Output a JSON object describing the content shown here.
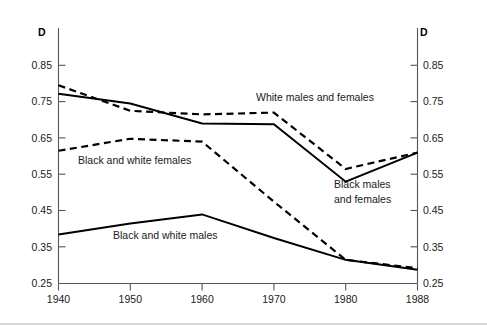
{
  "chart_data": {
    "type": "line",
    "title": "",
    "subtitle": "",
    "xlabel": "",
    "ylabel": "D",
    "ylabel_right": "D",
    "x": [
      1940,
      1950,
      1960,
      1970,
      1980,
      1988
    ],
    "categories": [
      "1940",
      "1950",
      "1960",
      "1970",
      "1980",
      "1988"
    ],
    "xticklabels": [
      "1940",
      "1950",
      "1960",
      "1970",
      "1980",
      "1988"
    ],
    "yticks": [
      0.25,
      0.35,
      0.45,
      0.55,
      0.65,
      0.75,
      0.85
    ],
    "yticklabels": [
      "0.25",
      "0.35",
      "0.45",
      "0.55",
      "0.65",
      "0.75",
      "0.85"
    ],
    "ylim": [
      0.25,
      0.85
    ],
    "grid": false,
    "legend_position": "inline-annotations",
    "axis_color": "#555555",
    "series_color": "#000000",
    "series": [
      {
        "name": "White males and females",
        "style": "dashed",
        "values": [
          0.795,
          0.725,
          0.715,
          0.72,
          0.565,
          0.61
        ]
      },
      {
        "name": "Black males and females",
        "style": "solid",
        "values": [
          0.772,
          0.745,
          0.69,
          0.688,
          0.53,
          0.61
        ]
      },
      {
        "name": "Black and white females",
        "style": "dashed",
        "values": [
          0.615,
          0.648,
          0.64,
          0.475,
          0.315,
          0.292
        ]
      },
      {
        "name": "Black and white males",
        "style": "solid",
        "values": [
          0.385,
          0.415,
          0.44,
          0.375,
          0.315,
          0.288
        ]
      }
    ],
    "annotations": [
      {
        "text": "White males and females",
        "x_px": 256,
        "y_px": 101
      },
      {
        "text": "Black and white females",
        "x_px": 78,
        "y_px": 164
      },
      {
        "text": "Black males",
        "x_px": 334,
        "y_px": 188
      },
      {
        "text": "and females",
        "x_px": 334,
        "y_px": 203
      },
      {
        "text": "Black and white males",
        "x_px": 113,
        "y_px": 239
      }
    ]
  }
}
